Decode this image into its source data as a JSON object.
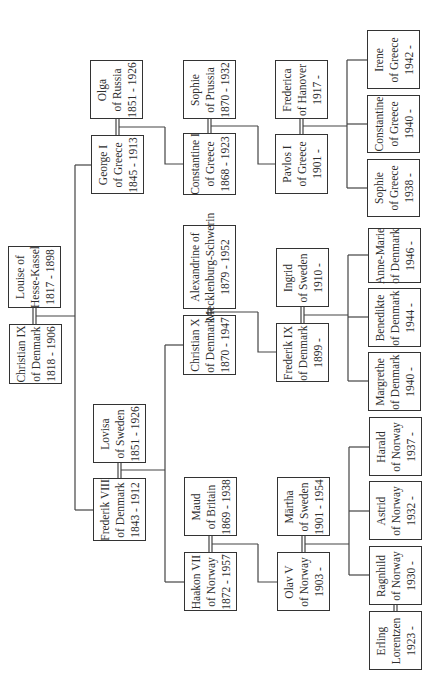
{
  "orientation": "rotated 90 degrees counter-clockwise",
  "people": {
    "christian_ix": {
      "name": "Christian IX",
      "title": "of Denmark",
      "years": "1818 - 1906",
      "box": [
        9,
        324,
        62,
        384
      ]
    },
    "louise": {
      "name": "Louise of",
      "title": "Hesse-Kassel",
      "years": "1817 - 1898",
      "box": [
        8,
        246,
        61,
        308
      ]
    },
    "george_i": {
      "name": "George I",
      "title": "of Greece",
      "years": "1845 - 1913",
      "box": [
        91,
        135,
        144,
        194
      ]
    },
    "olga": {
      "name": "Olga",
      "title": "of Russia",
      "years": "1851 - 1926",
      "box": [
        90,
        60,
        143,
        119
      ]
    },
    "constantine_i": {
      "name": "Constantine I",
      "title": "of Greece",
      "years": "1868 - 1923",
      "box": [
        183,
        133,
        236,
        195
      ]
    },
    "sophie_prussia": {
      "name": "Sophie",
      "title": "of Prussia",
      "years": "1870 - 1932",
      "box": [
        183,
        60,
        236,
        119
      ]
    },
    "pavlos_i": {
      "name": "Pavlos I",
      "title": "of Greece",
      "years": "1901 -",
      "box": [
        275,
        134,
        328,
        194
      ]
    },
    "frederica": {
      "name": "Frederica",
      "title": "of Hanover",
      "years": "1917 -",
      "box": [
        275,
        60,
        328,
        119
      ]
    },
    "sophie_greece": {
      "name": "Sophie",
      "title": "of Greece",
      "years": "1938 -",
      "box": [
        367,
        159,
        420,
        217
      ]
    },
    "constantine_greece": {
      "name": "Constantine",
      "title": "of Greece",
      "years": "1940 -",
      "box": [
        367,
        95,
        420,
        153
      ]
    },
    "irene": {
      "name": "Irene",
      "title": "of Greece",
      "years": "1942 -",
      "box": [
        367,
        30,
        420,
        89
      ]
    },
    "frederik_viii": {
      "name": "Frederik VIII",
      "title": "of Denmark",
      "years": "1843 - 1912",
      "box": [
        93,
        478,
        146,
        541
      ]
    },
    "lovisa": {
      "name": "Lovisa",
      "title": "of Sweden",
      "years": "1851 - 1926",
      "box": [
        93,
        404,
        146,
        463
      ]
    },
    "christian_x": {
      "name": "Christian X",
      "title": "of Denmark",
      "years": "1870 - 1947",
      "box": [
        183,
        315,
        236,
        375
      ]
    },
    "alexandrine": {
      "name": "Alexandrine of",
      "title": "Mecklenburg-Schwerin",
      "years": "1879 - 1952",
      "box": [
        183,
        225,
        236,
        309
      ]
    },
    "frederik_ix": {
      "name": "Frederik IX",
      "title": "of Denmark",
      "years": "1899 -",
      "box": [
        276,
        323,
        329,
        382
      ]
    },
    "ingrid": {
      "name": "Ingrid",
      "title": "of Sweden",
      "years": "1910 -",
      "box": [
        276,
        248,
        329,
        307
      ]
    },
    "margrethe": {
      "name": "Margrethe",
      "title": "of Denmark",
      "years": "1940 -",
      "box": [
        368,
        352,
        421,
        411
      ]
    },
    "benedikte": {
      "name": "Benedikte",
      "title": "of Denmark",
      "years": "1944 -",
      "box": [
        368,
        288,
        421,
        347
      ]
    },
    "anne_marie": {
      "name": "Anne-Marie",
      "title": "of Denmark",
      "years": "1946 -",
      "box": [
        368,
        228,
        421,
        283
      ]
    },
    "haakon_vii": {
      "name": "Haakon VII",
      "title": "of Norway",
      "years": "1872 - 1957",
      "box": [
        184,
        552,
        237,
        611
      ]
    },
    "maud": {
      "name": "Maud",
      "title": "of Britain",
      "years": "1869 - 1938",
      "box": [
        184,
        477,
        237,
        536
      ]
    },
    "olav_v": {
      "name": "Olav V",
      "title": "of Norway",
      "years": "1903 -",
      "box": [
        277,
        552,
        330,
        611
      ]
    },
    "martha": {
      "name": "Märtha",
      "title": "of Sweden",
      "years": "1901 - 1954",
      "box": [
        277,
        477,
        330,
        536
      ]
    },
    "ragnhild": {
      "name": "Ragnhild",
      "title": "of Norway",
      "years": "1930 -",
      "box": [
        369,
        546,
        422,
        605
      ]
    },
    "erling": {
      "name": "Erling",
      "title": "Lorentzen",
      "years": "1923 -",
      "box": [
        369,
        611,
        422,
        670
      ]
    },
    "astrid": {
      "name": "Astrid",
      "title": "of Norway",
      "years": "1932 -",
      "box": [
        369,
        481,
        422,
        540
      ]
    },
    "harald": {
      "name": "Harald",
      "title": "of Norway",
      "years": "1937 -",
      "box": [
        369,
        417,
        422,
        476
      ]
    }
  },
  "colors": {
    "line": "#444444",
    "box_border": "#333333",
    "text": "#2e2e2e",
    "background": "#ffffff"
  }
}
